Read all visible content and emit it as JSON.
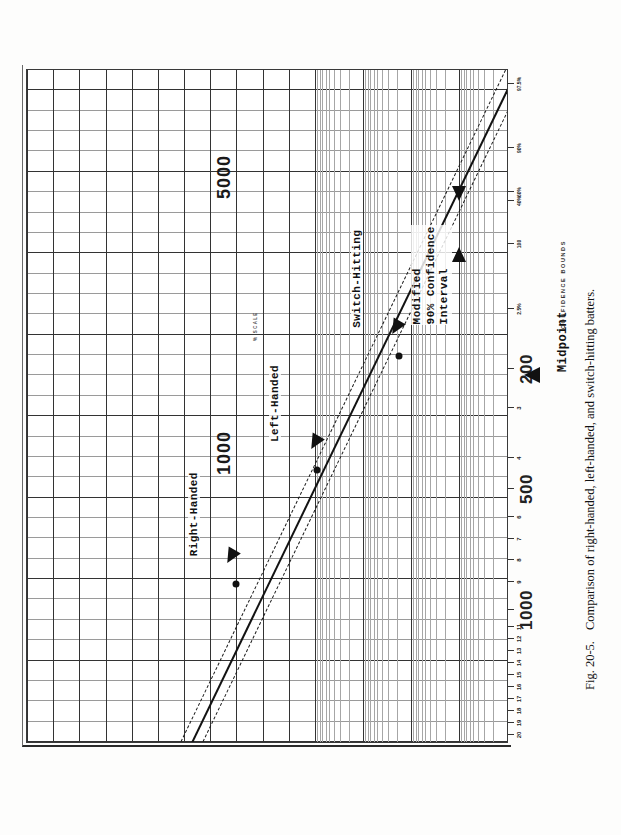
{
  "figure": {
    "caption_number": "Fig. 20-5.",
    "caption_text": "Comparison of right-handed, left-handed, and switch-hitting batters.",
    "orientation": "rotated-90-ccw"
  },
  "axis": {
    "scale_note": "% SCALE",
    "confidence_note": "CONFIDENCE BOUNDS",
    "major_labels": [
      "1000",
      "500",
      "200",
      "100"
    ],
    "edge_labels": [
      "5000",
      "1000"
    ],
    "minor_labels": [
      "20",
      "19",
      "18",
      "17",
      "16",
      "15",
      "14",
      "13",
      "12",
      "11",
      "9",
      "8",
      "7",
      "6",
      "4",
      "3"
    ],
    "percent_labels": [
      "2.5%",
      "40%",
      "60%",
      "90%",
      "97.5%"
    ]
  },
  "annotations": {
    "right_handed": "Right-Handed",
    "left_handed": "Left-Handed",
    "switch_hitting": "Switch-Hitting",
    "confidence_interval": "Modified\n90% Confidence\nInterval",
    "midpoint": "Midpoint"
  },
  "chart_data": {
    "type": "scatter",
    "title": "Comparison of right-handed, left-handed, and switch-hitting batters.",
    "subtitle": "Fig. 20-5.",
    "xlabel": "",
    "ylabel": "",
    "grid": true,
    "legend": "inline-annotations",
    "axis_type": "log-probability (binomial confidence-bound nomograph)",
    "x_tick_labels": [
      "20",
      "19",
      "18",
      "17",
      "16",
      "15",
      "14",
      "13",
      "12",
      "11",
      "1000",
      "9",
      "8",
      "7",
      "6",
      "500",
      "4",
      "3",
      "200",
      "2.5%",
      "100",
      "40%",
      "60%",
      "90%",
      "97.5%"
    ],
    "x_major_ticks": [
      {
        "label": "1000",
        "pos": 0.195
      },
      {
        "label": "500",
        "pos": 0.375
      },
      {
        "label": "200",
        "pos": 0.555
      },
      {
        "label": "100",
        "pos": 0.735
      }
    ],
    "edge_ticks": [
      {
        "label": "5000",
        "pos": 0.76
      },
      {
        "label": "1000",
        "pos": 0.4
      }
    ],
    "points": [
      {
        "name": "Right-Handed",
        "x": 0.255,
        "y": 0.455,
        "label": "Right-Handed"
      },
      {
        "name": "Left-Handed",
        "x": 0.4,
        "y": 0.6,
        "label": "Left-Handed"
      },
      {
        "name": "Switch-Hitting",
        "x": 0.565,
        "y": 0.77,
        "label": "Switch-Hitting"
      }
    ],
    "bands": [
      {
        "name": "central-estimate",
        "style": "solid"
      },
      {
        "name": "upper-90pct-bound",
        "style": "dashed"
      },
      {
        "name": "lower-90pct-bound",
        "style": "dashed"
      }
    ],
    "markers": [
      {
        "name": "Midpoint",
        "type": "up-triangle",
        "pos": 0.735
      },
      {
        "name": "interval-left-arrow",
        "type": "left-triangle"
      },
      {
        "name": "interval-right-arrow",
        "type": "right-triangle"
      }
    ]
  }
}
